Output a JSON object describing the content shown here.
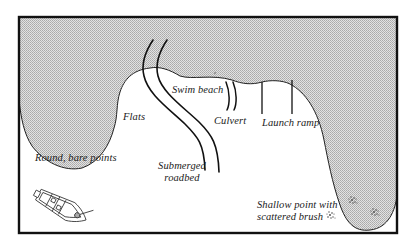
{
  "diagram": {
    "type": "lake structure map",
    "colors": {
      "water_fill": "#d8d8d8",
      "water_dots": "#a8a8a8",
      "land": "#ffffff",
      "lines": "#111111",
      "frame": "#111111"
    },
    "labels": {
      "flats": "Flats",
      "swim_beach": "Swim beach",
      "culvert": "Culvert",
      "launch_ramp": "Launch ramp",
      "round_bare_points": "Round, bare points",
      "submerged_roadbed_line1": "Submerged",
      "submerged_roadbed_line2": "roadbed",
      "shallow_point_line1": "Shallow point with",
      "shallow_point_line2": "scattered brush"
    },
    "features": [
      {
        "name": "shoreline",
        "icon": "shoreline-curve"
      },
      {
        "name": "submerged-roadbed",
        "icon": "double-line-road"
      },
      {
        "name": "culvert",
        "icon": "double-short-line"
      },
      {
        "name": "launch-ramp",
        "icon": "parallel-ramp-lines"
      },
      {
        "name": "boat",
        "icon": "boat-icon"
      },
      {
        "name": "brush",
        "icon": "brush-pile-icon",
        "count": 3
      }
    ]
  }
}
